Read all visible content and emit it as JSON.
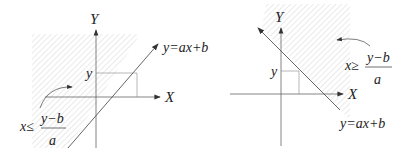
{
  "diagrams": [
    {
      "axis_x_label": "X",
      "axis_y_label": "Y",
      "point_label": "y",
      "line_label": "y=ax+b",
      "inequality": "x≤",
      "numerator": "y−b",
      "denominator": "a",
      "shaded_region": "left of line"
    },
    {
      "axis_x_label": "X",
      "axis_y_label": "Y",
      "point_label": "y",
      "line_label": "y=ax+b",
      "inequality": "x≥",
      "numerator": "y−b",
      "denominator": "a",
      "shaded_region": "right of line"
    }
  ],
  "colors": {
    "line": "#555555",
    "hatch": "#d8d8d8"
  }
}
